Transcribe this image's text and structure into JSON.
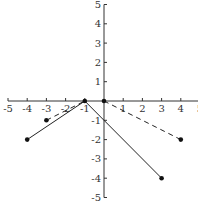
{
  "chart_data": {
    "type": "line",
    "title": "",
    "xlabel": "",
    "ylabel": "",
    "xlim": [
      -5,
      5
    ],
    "ylim": [
      -5,
      5
    ],
    "grid": false,
    "x_ticks": [
      -5,
      -4,
      -3,
      -2,
      -1,
      1,
      2,
      3,
      4,
      5
    ],
    "y_ticks": [
      5,
      4,
      3,
      2,
      1,
      -1,
      -2,
      -3,
      -4,
      -5
    ],
    "series": [
      {
        "name": "solid-segment-1",
        "style": "solid",
        "points": [
          [
            -4,
            -2
          ],
          [
            -1,
            0
          ]
        ]
      },
      {
        "name": "solid-segment-2",
        "style": "solid",
        "points": [
          [
            -1,
            0
          ],
          [
            3,
            -4
          ]
        ]
      },
      {
        "name": "dashed-segment-1",
        "style": "dashed",
        "points": [
          [
            -3,
            -1
          ],
          [
            -1,
            0
          ]
        ]
      },
      {
        "name": "dashed-segment-2",
        "style": "dashed",
        "points": [
          [
            0,
            0
          ],
          [
            4,
            -2
          ]
        ]
      }
    ],
    "markers": [
      [
        -4,
        -2
      ],
      [
        -3,
        -1
      ],
      [
        -1,
        0
      ],
      [
        0,
        0
      ],
      [
        3,
        -4
      ],
      [
        4,
        -2
      ]
    ]
  },
  "colors": {
    "axis": "#333333",
    "line": "#222222",
    "marker": "#111111"
  }
}
